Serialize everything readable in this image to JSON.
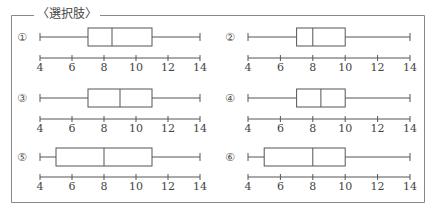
{
  "frame": {
    "title": "〈選択肢〉",
    "border_color": "#888888"
  },
  "chart_data": {
    "type": "boxplot",
    "title": "〈選択肢〉",
    "xlabel": "",
    "ylabel": "",
    "xlim": [
      4,
      14
    ],
    "x_ticks": [
      4,
      6,
      8,
      10,
      12,
      14
    ],
    "tick_labels": [
      "4",
      "6",
      "8",
      "10",
      "12",
      "14"
    ],
    "grid": false,
    "layout": "3 rows x 2 columns",
    "plots": [
      {
        "label": "①",
        "min": 4,
        "q1": 7,
        "median": 8.5,
        "q3": 11,
        "max": 14
      },
      {
        "label": "②",
        "min": 4,
        "q1": 7,
        "median": 8,
        "q3": 10,
        "max": 14
      },
      {
        "label": "③",
        "min": 4,
        "q1": 7,
        "median": 9,
        "q3": 11,
        "max": 14
      },
      {
        "label": "④",
        "min": 4,
        "q1": 7,
        "median": 8.5,
        "q3": 10,
        "max": 14
      },
      {
        "label": "⑤",
        "min": 4,
        "q1": 5,
        "median": 8,
        "q3": 11,
        "max": 14
      },
      {
        "label": "⑥",
        "min": 4,
        "q1": 5,
        "median": 8,
        "q3": 10,
        "max": 14
      }
    ]
  }
}
